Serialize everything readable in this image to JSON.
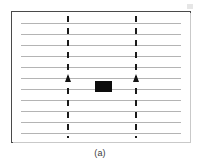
{
  "figure": {
    "caption": "(a)",
    "colors": {
      "frame_border": "#4a4a4a",
      "horizontal_rule": "#b4b4b4",
      "vertical_dashed_line": "#1a1a1a",
      "block_fill": "#0d0d0d",
      "background": "#ffffff"
    },
    "frame": {
      "x": 11,
      "y": 11,
      "width": 180,
      "height": 132
    },
    "horizontal_lines": {
      "count": 11,
      "y_positions": [
        22,
        33,
        44,
        55,
        66,
        77,
        88,
        99,
        110,
        121,
        132
      ],
      "inset_left": 9,
      "inset_right": 9
    },
    "vertical_dashed_lines": [
      {
        "name": "left-boundary",
        "x": 67
      },
      {
        "name": "right-boundary",
        "x": 135
      }
    ],
    "arrow_heads": [
      {
        "name": "left-arrow",
        "x": 67,
        "y": 74,
        "direction": "up"
      },
      {
        "name": "right-arrow",
        "x": 135,
        "y": 74,
        "direction": "up"
      }
    ],
    "block": {
      "name": "solid-black-block",
      "x": 94,
      "y": 80,
      "width": 17,
      "height": 11
    },
    "artifact": {
      "name": "scan-artifact"
    }
  }
}
